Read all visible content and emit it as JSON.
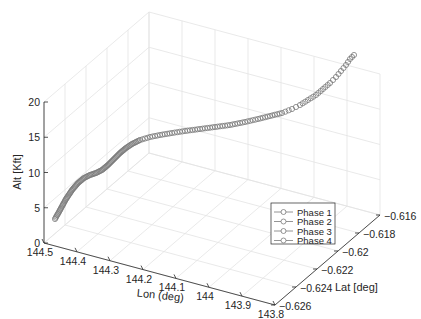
{
  "chart_data": {
    "type": "line3d",
    "title": "",
    "xlabel": "Lon (deg)",
    "ylabel": "Lat [deg]",
    "zlabel": "Alt [Kft]",
    "x_ticks": [
      "144.5",
      "144.4",
      "144.3",
      "144.2",
      "144.1",
      "144",
      "143.9",
      "143.8"
    ],
    "y_ticks": [
      "-0.626",
      "-0.624",
      "-0.622",
      "-0.62",
      "-0.618",
      "-0.616"
    ],
    "z_ticks": [
      "0",
      "5",
      "10",
      "15",
      "20"
    ],
    "xlim": [
      143.8,
      144.5
    ],
    "ylim": [
      -0.626,
      -0.615
    ],
    "zlim": [
      0,
      20
    ],
    "grid": true,
    "legend_position": "lower right",
    "legend": [
      "Phase 1",
      "Phase 2",
      "Phase 3",
      "Phase 4"
    ],
    "marker": "circle",
    "series": [
      {
        "name": "Trajectory",
        "points_screen_approx": [
          [
            55,
            219
          ],
          [
            60,
            210
          ],
          [
            66,
            199
          ],
          [
            72,
            190
          ],
          [
            78,
            183
          ],
          [
            84,
            178
          ],
          [
            90,
            175
          ],
          [
            96,
            173
          ],
          [
            102,
            170
          ],
          [
            108,
            165
          ],
          [
            114,
            159
          ],
          [
            120,
            153
          ],
          [
            126,
            148
          ],
          [
            132,
            144
          ],
          [
            140,
            140
          ],
          [
            150,
            137
          ],
          [
            160,
            135
          ],
          [
            172,
            133
          ],
          [
            185,
            131
          ],
          [
            200,
            129
          ],
          [
            215,
            127
          ],
          [
            230,
            125
          ],
          [
            245,
            122
          ],
          [
            258,
            119
          ],
          [
            270,
            116
          ],
          [
            282,
            113
          ],
          [
            292,
            109
          ],
          [
            300,
            105
          ],
          [
            308,
            100
          ],
          [
            316,
            95
          ],
          [
            323,
            89
          ],
          [
            330,
            83
          ],
          [
            336,
            77
          ],
          [
            341,
            71
          ],
          [
            346,
            65
          ],
          [
            350,
            59
          ],
          [
            354,
            55
          ]
        ]
      }
    ]
  },
  "axes": {
    "xlabel": "Lon (deg)",
    "ylabel": "Lat [deg]",
    "zlabel": "Alt [Kft]"
  },
  "legend": {
    "items": [
      {
        "label": "Phase 1"
      },
      {
        "label": "Phase 2"
      },
      {
        "label": "Phase 3"
      },
      {
        "label": "Phase 4"
      }
    ]
  }
}
